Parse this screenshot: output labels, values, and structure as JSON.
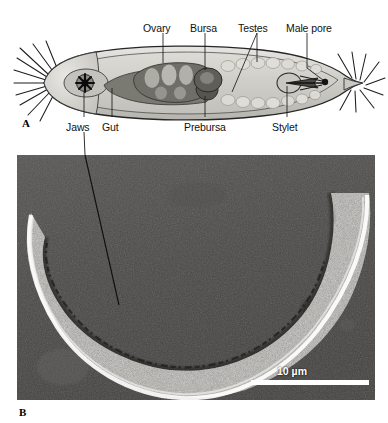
{
  "figure": {
    "panels": [
      {
        "id": "A",
        "letter": "A",
        "type": "anatomical-line-drawing",
        "subject": "gnathostomulid worm, lateral whole-mount schematic",
        "labels_above": [
          {
            "text": "Ovary",
            "x": 143,
            "y": 22,
            "leader_x": 163,
            "leader_y1": 33,
            "leader_y2": 63
          },
          {
            "text": "Bursa",
            "x": 190,
            "y": 22,
            "leader_x": 205,
            "leader_y1": 33,
            "leader_y2": 70
          },
          {
            "text": "Testes",
            "x": 238,
            "y": 22,
            "leader_x": 257,
            "leader_y1": 33,
            "leader_y2": 62
          },
          {
            "text": "Male pore",
            "x": 286,
            "y": 22,
            "leader_x": 307,
            "leader_y1": 33,
            "leader_y2": 68
          }
        ],
        "labels_below": [
          {
            "text": "Jaws",
            "x": 66,
            "y": 121,
            "leader_x": 84,
            "leader_y1": 97,
            "leader_y2": 117
          },
          {
            "text": "Gut",
            "x": 102,
            "y": 121,
            "leader_x": 112,
            "leader_y1": 90,
            "leader_y2": 117
          },
          {
            "text": "Prebursa",
            "x": 184,
            "y": 121,
            "leader_x": 205,
            "leader_y1": 93,
            "leader_y2": 117
          },
          {
            "text": "Stylet",
            "x": 272,
            "y": 121,
            "leader_x": 287,
            "leader_y1": 88,
            "leader_y2": 117
          }
        ]
      },
      {
        "id": "B",
        "letter": "B",
        "type": "dic-light-micrograph",
        "subject": "crescent-shaped living specimen, differential interference contrast",
        "scalebar": {
          "label": "10 µm",
          "length_px": 118
        }
      }
    ]
  },
  "colors": {
    "page_background": "#ffffff",
    "ink": "#111111",
    "body_outline": "#2b2b2b",
    "body_fill_light": "#d9d8d4",
    "body_fill_mid": "#b9b8b2",
    "gut_dark": "#6e6d69",
    "ovary_dark": "#7b7a75",
    "bursa_dark": "#5e5d59",
    "testes_light": "#cfcec9",
    "micrograph_background": "#4b4b4b",
    "micrograph_specimen": "#b9b8b3",
    "micrograph_halo": "#ffffff",
    "scalebar": "#ffffff"
  }
}
